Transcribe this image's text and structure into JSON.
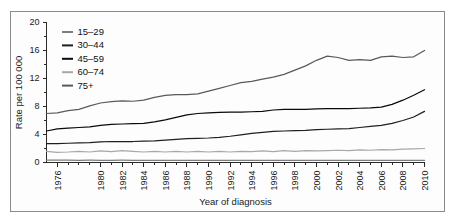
{
  "chart_data": {
    "type": "line",
    "title": "",
    "xlabel": "Year of diagnosis",
    "ylabel": "Rate per 100 000",
    "xlim": [
      1975,
      2010
    ],
    "ylim": [
      0,
      20
    ],
    "ytick_values": [
      0,
      4,
      8,
      12,
      16,
      20
    ],
    "ytick_labels": [
      "0",
      "4",
      "8",
      "12",
      "16",
      "20"
    ],
    "y_minor_step": 2,
    "xtick_values": [
      1976,
      1978,
      1980,
      1982,
      1984,
      1986,
      1988,
      1990,
      1992,
      1994,
      1996,
      1998,
      2000,
      2002,
      2004,
      2006,
      2008,
      2010
    ],
    "xtick_labels": [
      "1976",
      "",
      "1980",
      "1982",
      "1984",
      "1986",
      "1988",
      "1990",
      "1992",
      "1994",
      "1996",
      "1998",
      "2000",
      "2002",
      "2004",
      "2006",
      "2008",
      "2010"
    ],
    "x_minor_step": 1,
    "grid": false,
    "legend_position": "top-left",
    "x": [
      1975,
      1976,
      1977,
      1978,
      1979,
      1980,
      1981,
      1982,
      1983,
      1984,
      1985,
      1986,
      1987,
      1988,
      1989,
      1990,
      1991,
      1992,
      1993,
      1994,
      1995,
      1996,
      1997,
      1998,
      1999,
      2000,
      2001,
      2002,
      2003,
      2004,
      2005,
      2006,
      2007,
      2008,
      2009,
      2010
    ],
    "series": [
      {
        "name": "15-29",
        "color": "#7d7d7d",
        "width": 1.1,
        "values": [
          0.35,
          0.33,
          0.34,
          0.32,
          0.33,
          0.31,
          0.32,
          0.33,
          0.31,
          0.3,
          0.32,
          0.31,
          0.3,
          0.32,
          0.31,
          0.3,
          0.31,
          0.3,
          0.29,
          0.3,
          0.31,
          0.3,
          0.29,
          0.3,
          0.31,
          0.3,
          0.29,
          0.3,
          0.29,
          0.3,
          0.29,
          0.3,
          0.29,
          0.3,
          0.29,
          0.3
        ]
      },
      {
        "name": "30-44",
        "color": "#1f1f1f",
        "width": 1.5,
        "values": [
          2.7,
          2.7,
          2.75,
          2.8,
          2.85,
          2.95,
          3.0,
          3.0,
          3.0,
          3.05,
          3.1,
          3.2,
          3.3,
          3.4,
          3.45,
          3.5,
          3.6,
          3.75,
          3.95,
          4.15,
          4.3,
          4.45,
          4.5,
          4.55,
          4.6,
          4.7,
          4.75,
          4.8,
          4.85,
          5.0,
          5.15,
          5.3,
          5.6,
          6.0,
          6.5,
          7.3
        ]
      },
      {
        "name": "45-59",
        "color": "#0a0a0a",
        "width": 1.8,
        "values": [
          4.5,
          4.8,
          4.9,
          5.0,
          5.1,
          5.3,
          5.45,
          5.5,
          5.55,
          5.6,
          5.8,
          6.1,
          6.45,
          6.8,
          7.0,
          7.1,
          7.15,
          7.2,
          7.2,
          7.25,
          7.3,
          7.5,
          7.6,
          7.6,
          7.6,
          7.65,
          7.7,
          7.7,
          7.7,
          7.75,
          7.8,
          7.9,
          8.3,
          8.9,
          9.6,
          10.4
        ]
      },
      {
        "name": "60-74",
        "color": "#a8a8a8",
        "width": 1.1,
        "values": [
          1.6,
          1.45,
          1.5,
          1.6,
          1.5,
          1.65,
          1.55,
          1.7,
          1.6,
          1.5,
          1.6,
          1.5,
          1.6,
          1.5,
          1.6,
          1.5,
          1.6,
          1.5,
          1.6,
          1.55,
          1.65,
          1.55,
          1.7,
          1.6,
          1.7,
          1.65,
          1.7,
          1.75,
          1.7,
          1.8,
          1.75,
          1.85,
          1.8,
          1.9,
          1.95,
          2.0
        ]
      },
      {
        "name": "75+",
        "color": "#5a5a5a",
        "width": 1.4,
        "values": [
          7.0,
          7.1,
          7.4,
          7.6,
          8.1,
          8.5,
          8.7,
          8.8,
          8.75,
          8.9,
          9.3,
          9.6,
          9.7,
          9.7,
          9.8,
          10.2,
          10.6,
          11.0,
          11.4,
          11.6,
          11.9,
          12.2,
          12.6,
          13.2,
          13.8,
          14.6,
          15.2,
          15.0,
          14.6,
          14.7,
          14.6,
          15.1,
          15.2,
          15.0,
          15.1,
          16.0
        ]
      }
    ]
  }
}
